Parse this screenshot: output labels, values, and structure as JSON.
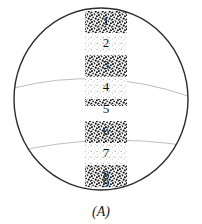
{
  "figure": {
    "caption": "(A)",
    "shape": {
      "name": "sphere-outline",
      "cx": 101,
      "cy": 99,
      "rx": 87,
      "ry": 91,
      "stroke_color": "#2b2b2b"
    },
    "latitude_arcs": [
      {
        "name": "upper-latitude-arc",
        "stroke_color": "#b9b9b9"
      },
      {
        "name": "lower-latitude-arc",
        "stroke_color": "#b9b9b9"
      }
    ],
    "band": {
      "name": "vertical-stipple-band",
      "x": 85,
      "width": 42,
      "fill_light": "#f2f2f2",
      "fill_dense": "#ffffff",
      "dot_color": "#1b1b1b"
    },
    "zones": [
      {
        "label": "1",
        "texture": "dense",
        "y": 11,
        "height": 22
      },
      {
        "label": "2",
        "texture": "light",
        "y": 33,
        "height": 22
      },
      {
        "label": "3",
        "texture": "dense",
        "y": 55,
        "height": 22
      },
      {
        "label": "4",
        "texture": "light",
        "y": 77,
        "height": 22
      },
      {
        "label": "5",
        "texture": "dense",
        "y": 99,
        "height": 22
      },
      {
        "label": "6",
        "texture": "dense",
        "y": 121,
        "height": 22
      },
      {
        "label": "7",
        "texture": "light",
        "y": 143,
        "height": 22
      },
      {
        "label": "8",
        "texture": "dense",
        "y": 165,
        "height": 22
      },
      {
        "label": "9",
        "texture": "light",
        "y": 187,
        "height": 22
      }
    ]
  }
}
